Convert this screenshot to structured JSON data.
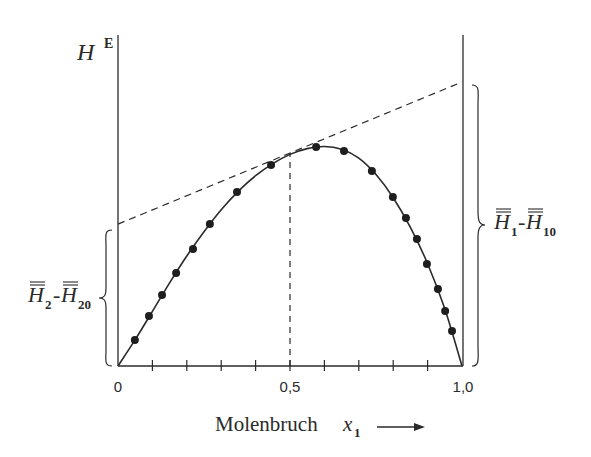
{
  "chart_data": {
    "type": "line",
    "title": "",
    "ylabel": "H",
    "ylabel_superscript": "E",
    "xlabel": "Molenbruch",
    "xlabel_variable": "x",
    "xlabel_subscript": "1",
    "xlim": [
      0,
      1.0
    ],
    "ylim": [
      0,
      1.4
    ],
    "y_units": "arbitrary (normalized, peak ≈ 1.0)",
    "grid": false,
    "x_ticks": [
      0,
      0.1,
      0.2,
      0.3,
      0.4,
      0.5,
      0.6,
      0.7,
      0.8,
      0.9,
      1.0
    ],
    "x_tick_labels": [
      {
        "value": 0,
        "label": "0"
      },
      {
        "value": 0.5,
        "label": "0,5"
      },
      {
        "value": 1.0,
        "label": "1,0"
      }
    ],
    "series": [
      {
        "name": "measured points",
        "style": "markers",
        "x": [
          0.049,
          0.09,
          0.128,
          0.169,
          0.218,
          0.267,
          0.346,
          0.445,
          0.576,
          0.657,
          0.738,
          0.799,
          0.837,
          0.869,
          0.898,
          0.93,
          0.951,
          0.971
        ],
        "y": [
          0.118,
          0.227,
          0.323,
          0.423,
          0.532,
          0.645,
          0.791,
          0.914,
          0.995,
          0.977,
          0.886,
          0.768,
          0.673,
          0.577,
          0.464,
          0.35,
          0.25,
          0.159
        ]
      },
      {
        "name": "fitted curve",
        "style": "solid-line",
        "x": [
          0,
          0.05,
          0.1,
          0.15,
          0.2,
          0.25,
          0.3,
          0.35,
          0.4,
          0.45,
          0.5,
          0.55,
          0.6,
          0.65,
          0.7,
          0.75,
          0.8,
          0.85,
          0.9,
          0.95,
          1.0
        ],
        "y": [
          0,
          0.12,
          0.248,
          0.378,
          0.5,
          0.61,
          0.71,
          0.795,
          0.865,
          0.92,
          0.962,
          0.988,
          0.998,
          0.985,
          0.945,
          0.87,
          0.765,
          0.63,
          0.465,
          0.26,
          0
        ]
      },
      {
        "name": "tangent at x1 = 0,5",
        "style": "dashed-line",
        "x": [
          0,
          1.0
        ],
        "y": [
          0.645,
          1.291
        ]
      },
      {
        "name": "vertical at x1 = 0,5",
        "style": "dashed-line",
        "x": [
          0.5,
          0.5
        ],
        "y": [
          0,
          0.968
        ]
      }
    ],
    "annotations": [
      {
        "text": "H̄₂-H̄₂₀",
        "position": "left brace",
        "spans_y": [
          0,
          0.645
        ],
        "meaning": "intercept of tangent at x1 = 0"
      },
      {
        "text": "H̄₁-H̄₁₀",
        "position": "right brace",
        "spans_y": [
          0,
          1.291
        ],
        "meaning": "intercept of tangent at x1 = 1"
      }
    ]
  },
  "labels": {
    "y_axis_main": "H",
    "y_axis_sup": "E",
    "x_axis_text": "Molenbruch",
    "x_axis_var": "x",
    "x_axis_sub": "1",
    "tick_0": "0",
    "tick_05": "0,5",
    "tick_10": "1,0",
    "left_brace": {
      "main1": "H",
      "sub1": "2",
      "dash": "-",
      "main2": "H",
      "sub2": "20"
    },
    "right_brace": {
      "main1": "H",
      "sub1": "1",
      "dash": "-",
      "main2": "H",
      "sub2": "10"
    }
  },
  "colors": {
    "ink": "#2a2a2a",
    "background": "#ffffff"
  }
}
